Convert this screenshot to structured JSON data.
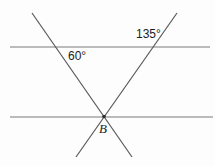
{
  "diagram": {
    "colors": {
      "background": "#fdfdfd",
      "parallel_line": "#7a7a7a",
      "transversal_line": "#585858",
      "text": "#1c1c1c",
      "point_dot": "#2e2e2e"
    },
    "labels": {
      "angle_top_right": "135°",
      "angle_left": "60°",
      "point": "B"
    },
    "lines": {
      "parallel_top": {
        "x1": 10,
        "y1": 47,
        "x2": 210,
        "y2": 47
      },
      "parallel_bottom": {
        "x1": 10,
        "y1": 117,
        "x2": 213,
        "y2": 117
      },
      "transversal_left": {
        "x1": 32,
        "y1": 13,
        "x2": 132,
        "y2": 157
      },
      "transversal_right": {
        "x1": 177,
        "y1": 13,
        "x2": 76,
        "y2": 157
      }
    },
    "point_b": {
      "cx": 104,
      "cy": 116.5,
      "r": 1.8
    },
    "stroke_width": 1.2
  }
}
